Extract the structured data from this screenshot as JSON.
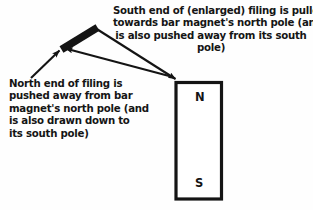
{
  "diagram": {
    "title_text": "Magnetic filing near a bar magnet",
    "background_color": "#fefefe",
    "ink_color": "#141414"
  },
  "captions": {
    "south_end": "South end of (enlarged) filing is pulled\ntowards bar magnet's north pole (and\nis also pushed away from its south\npole)",
    "north_end": "North end of filing is\npushed away from bar\nmagnet's north pole (and\nis also drawn down to\nits south pole)"
  },
  "magnet": {
    "north_label": "N",
    "south_label": "S",
    "border_color": "#141414",
    "fill_color": "#ffffff"
  },
  "filing": {
    "label": "iron filing",
    "color": "#141414"
  },
  "arrows": [
    {
      "name": "south-end-arrow",
      "from": "filing-south-end",
      "to": "magnet-north-pole"
    },
    {
      "name": "north-end-arrow-from-magnet",
      "from": "magnet-north-pole",
      "to": "filing-north-end"
    },
    {
      "name": "north-end-arrow-from-caption",
      "from": "north-caption",
      "to": "filing-north-end"
    }
  ]
}
